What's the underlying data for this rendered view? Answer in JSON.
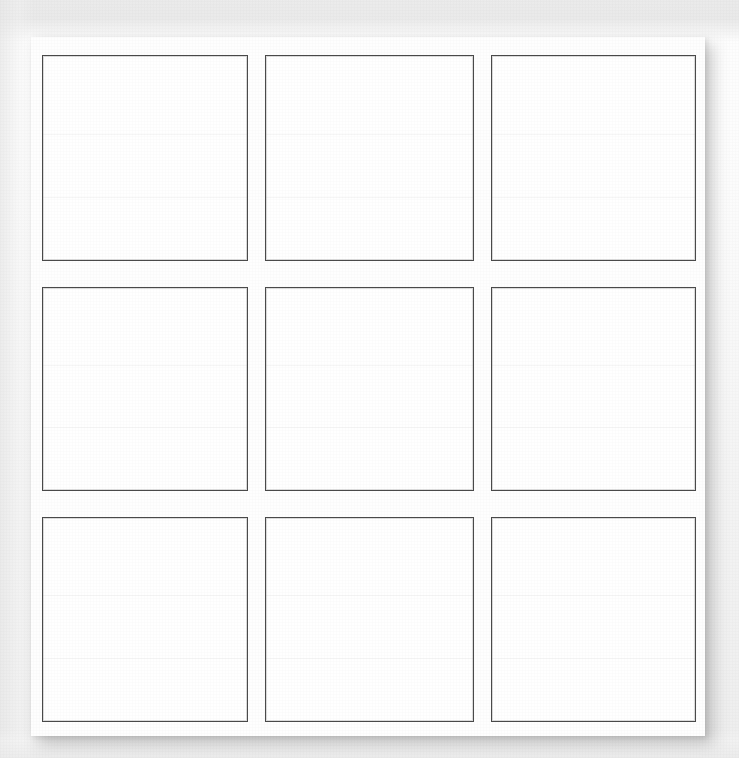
{
  "document": {
    "kind": "scanned-page",
    "title": "Blank 3x3 grid worksheet",
    "background_color": "#efefef",
    "sheet_color": "#fefefe",
    "border_color": "#4a4a4a",
    "shadow_color": "#464646"
  },
  "top_edge_fragment": {
    "text": "••",
    "note": "partial glyph clipped by the top edge of the scan"
  },
  "grid": {
    "rows": 3,
    "columns": 3,
    "cells": [
      {
        "id": "cell-r1c1",
        "row": 1,
        "column": 1,
        "text": ""
      },
      {
        "id": "cell-r1c2",
        "row": 1,
        "column": 2,
        "text": ""
      },
      {
        "id": "cell-r1c3",
        "row": 1,
        "column": 3,
        "text": ""
      },
      {
        "id": "cell-r2c1",
        "row": 2,
        "column": 1,
        "text": ""
      },
      {
        "id": "cell-r2c2",
        "row": 2,
        "column": 2,
        "text": ""
      },
      {
        "id": "cell-r2c3",
        "row": 2,
        "column": 3,
        "text": ""
      },
      {
        "id": "cell-r3c1",
        "row": 3,
        "column": 1,
        "text": ""
      },
      {
        "id": "cell-r3c2",
        "row": 3,
        "column": 2,
        "text": ""
      },
      {
        "id": "cell-r3c3",
        "row": 3,
        "column": 3,
        "text": ""
      }
    ]
  }
}
